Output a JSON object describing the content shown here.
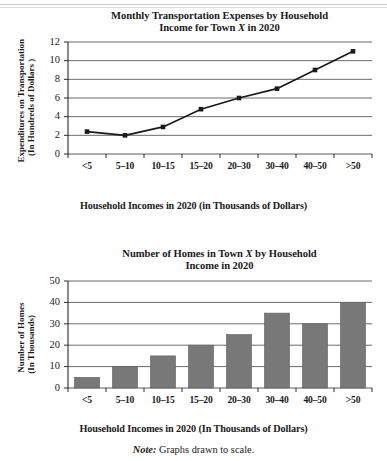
{
  "document": {
    "note_label": "Note:",
    "note_text": " Graphs drawn to scale."
  },
  "chart_data": [
    {
      "type": "line",
      "id": "monthly-transportation-expenses",
      "title_line1": "Monthly Transportation Expenses by Household",
      "title_line2_pre": "Income for Town ",
      "title_line2_italic": "X",
      "title_line2_post": " in 2020",
      "title": "Monthly Transportation Expenses by Household Income for Town X in 2020",
      "xlabel": "Household Incomes in 2020 (in Thousands of Dollars)",
      "ylabel_line1": "Expenditures on Transportation",
      "ylabel_line2": "(In Hundreds of Dollars )",
      "ylabel": "Expenditures on Transportation (In Hundreds of Dollars )",
      "categories": [
        "<5",
        "5–10",
        "10–15",
        "15–20",
        "20–30",
        "30–40",
        "40–50",
        ">50"
      ],
      "values": [
        2.4,
        2.0,
        2.9,
        4.8,
        6.0,
        7.0,
        9.0,
        11.0
      ],
      "yticks": [
        0,
        2,
        4,
        6,
        8,
        10,
        12
      ],
      "ylim": [
        0,
        12
      ],
      "grid": true,
      "legend": "none",
      "marker": "square",
      "line_color": "#1a1a1a"
    },
    {
      "type": "bar",
      "id": "number-of-homes",
      "title_line1_pre": "Number of Homes in Town ",
      "title_line1_italic": "X",
      "title_line1_post": " by Household",
      "title_line2": "Income in 2020",
      "title": "Number of Homes in Town X by Household Income in 2020",
      "xlabel": "Household Incomes in 2020 (In Thousands of Dollars)",
      "ylabel_line1": "Number of Homes",
      "ylabel_line2": "(In Thousands)",
      "ylabel": "Number of Homes (In Thousands)",
      "categories": [
        "<5",
        "5–10",
        "10–15",
        "15–20",
        "20–30",
        "30–40",
        "40–50",
        ">50"
      ],
      "values": [
        5,
        10,
        15,
        20,
        25,
        35,
        30,
        40
      ],
      "yticks": [
        0,
        10,
        20,
        30,
        40,
        50
      ],
      "ylim": [
        0,
        50
      ],
      "grid": true,
      "legend": "none",
      "bar_color": "#787878"
    }
  ]
}
